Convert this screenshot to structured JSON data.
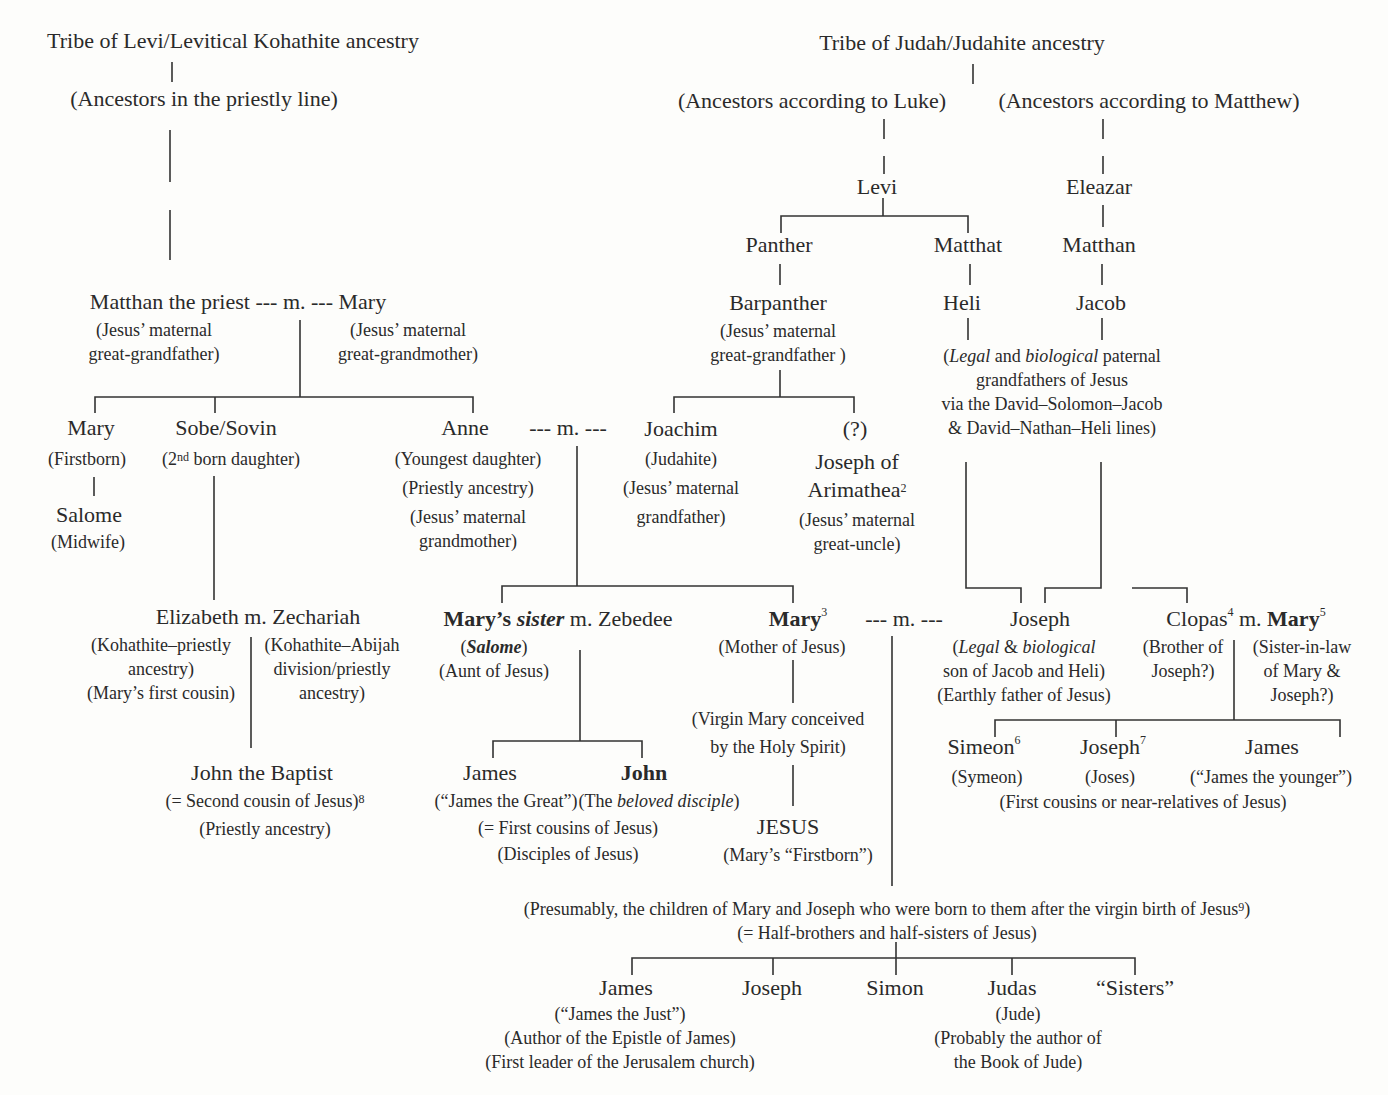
{
  "left_tree": {
    "root": "Tribe of Levi/Levitical Kohathite ancestry",
    "ancestors": "(Ancestors in the priestly line)",
    "matthan": {
      "name": "Matthan the priest --- m. --- Mary",
      "note_left_1": "(Jesus’ maternal",
      "note_left_2": "great-grandfather)",
      "note_right_1": "(Jesus’ maternal",
      "note_right_2": "great-grandmother)"
    },
    "mary_first": {
      "name": "Mary",
      "note": "(Firstborn)"
    },
    "salome_midwife": {
      "name": "Salome",
      "note": "(Midwife)"
    },
    "sobe": {
      "name": "Sobe/Sovin",
      "note_pre": "(2",
      "note_sup": "nd",
      "note_post": " born daughter)"
    },
    "anne": {
      "name": "Anne",
      "marriage": "---   m.   ---",
      "note_1": "(Youngest daughter)",
      "note_2": "(Priestly ancestry)",
      "note_3": "(Jesus’ maternal",
      "note_4": "grandmother)"
    },
    "elizabeth": {
      "name": "Elizabeth m. Zechariah",
      "left_1": "(Kohathite–priestly",
      "left_2": "ancestry)",
      "left_3": "(Mary’s first cousin)",
      "right_1": "(Kohathite–Abijah",
      "right_2": "division/priestly",
      "right_3": "ancestry)"
    },
    "john_baptist": {
      "name": "John the Baptist",
      "note_1": "(= Second cousin of Jesus)",
      "note_1_sup": "8",
      "note_2": "(Priestly ancestry)"
    }
  },
  "right_tree": {
    "root": "Tribe of Judah/Judahite ancestry",
    "luke": "(Ancestors according to Luke)",
    "matthew": "(Ancestors according to Matthew)",
    "levi": "Levi",
    "eleazar": "Eleazar",
    "panther": "Panther",
    "matthat": "Matthat",
    "matthan": "Matthan",
    "barpanther": {
      "name": "Barpanther",
      "note_1": "(Jesus’ maternal",
      "note_2": "great-grandfather )"
    },
    "heli": "Heli",
    "jacob": "Jacob",
    "grandfathers_note": {
      "l1_pre": "(",
      "l1_legal": "Legal",
      "l1_and": " and ",
      "l1_bio": "biological",
      "l1_post": " paternal",
      "l2": "grandfathers of Jesus",
      "l3": "via the David–Solomon–Jacob",
      "l4": "& David–Nathan–Heli lines)"
    },
    "joachim": {
      "name": "Joachim",
      "note_1": "(Judahite)",
      "note_2": "(Jesus’ maternal",
      "note_3": "grandfather)"
    },
    "joseph_arimathea": {
      "q": "(?)",
      "name_1": "Joseph of",
      "name_2": "Arimathea",
      "sup": "2",
      "note_1": "(Jesus’ maternal",
      "note_2": "great-uncle)"
    }
  },
  "generation_mary": {
    "marys_sister": {
      "bold": "Mary’s ",
      "italic_bold": "sister",
      "rest": " m. Zebedee",
      "salome": "Salome",
      "note": "(Aunt of Jesus)"
    },
    "mary": {
      "name": "Mary",
      "sup": "3",
      "marriage": "---     m.     ---",
      "note": "(Mother of Jesus)",
      "virgin_1": "(Virgin Mary conceived",
      "virgin_2": "by the Holy Spirit)"
    },
    "joseph": {
      "name": "Joseph",
      "l1_legal": "Legal",
      "l1_amp": " & ",
      "l1_bio": "biological",
      "l2": "son of Jacob and Heli)",
      "l3": "(Earthly father of Jesus)"
    },
    "clopas": {
      "name": "Clopas",
      "sup": "4",
      "m": " m. ",
      "mary": "Mary",
      "mary_sup": "5",
      "left_1": "(Brother of",
      "left_2": "Joseph?)",
      "right_1": "(Sister-in-law",
      "right_2": "of Mary &",
      "right_3": "Joseph?)"
    }
  },
  "generation_children": {
    "james_great": {
      "name": "James",
      "note": "(“James the Great”)"
    },
    "john": {
      "name": "John",
      "pre": "(The ",
      "italic": "beloved disciple",
      "post": ")"
    },
    "zebedee_note_1": "(= First cousins of Jesus)",
    "zebedee_note_2": "(Disciples of Jesus)",
    "jesus": {
      "name": "JESUS",
      "note": "(Mary’s “Firstborn”)"
    },
    "simeon": {
      "name": "Simeon",
      "sup": "6",
      "note": "(Symeon)"
    },
    "joseph_joses": {
      "name": "Joseph",
      "sup": "7",
      "note": "(Joses)"
    },
    "james_younger": {
      "name": "James",
      "note": "(“James the younger”)"
    },
    "clopas_note": "(First cousins or near-relatives of Jesus)"
  },
  "half_siblings": {
    "note_1": "(Presumably, the children of Mary and Joseph who were born to them after the virgin birth of Jesus",
    "note_1_sup": "9",
    "note_1_end": ")",
    "note_2": "(= Half-brothers and half-sisters of Jesus)",
    "james": {
      "name": "James",
      "note_1": "(“James the Just”)",
      "note_2": "(Author of the Epistle of James)",
      "note_3": "(First leader of the Jerusalem church)"
    },
    "joseph": "Joseph",
    "simon": "Simon",
    "judas": {
      "name": "Judas",
      "note_1": "(Jude)",
      "note_2": "(Probably the author of",
      "note_3": "the Book of Jude)"
    },
    "sisters": "“Sisters”"
  }
}
